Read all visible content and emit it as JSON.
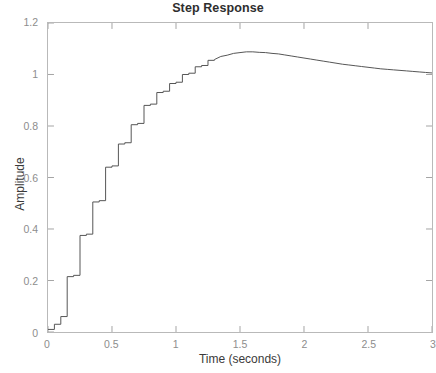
{
  "chart_data": {
    "type": "line",
    "title": "Step Response",
    "xlabel": "Time (seconds)",
    "ylabel": "Amplitude",
    "xlim": [
      0,
      3
    ],
    "ylim": [
      0,
      1.2
    ],
    "xticks": [
      "0",
      "0.5",
      "1",
      "1.5",
      "2",
      "2.5",
      "3"
    ],
    "xtick_values": [
      0,
      0.5,
      1,
      1.5,
      2,
      2.5,
      3
    ],
    "yticks": [
      "0",
      "0.2",
      "0.4",
      "0.6",
      "0.8",
      "1",
      "1.2"
    ],
    "ytick_values": [
      0,
      0.2,
      0.4,
      0.6,
      0.8,
      1,
      1.2
    ],
    "grid": false,
    "legend": null,
    "line_color": "#555555",
    "line_width": 1,
    "drawstyle": "steps-post",
    "sample_period": 0.05,
    "series": [
      {
        "name": "Step Response",
        "x": [
          0.0,
          0.05,
          0.1,
          0.15,
          0.2,
          0.25,
          0.3,
          0.35,
          0.4,
          0.45,
          0.5,
          0.55,
          0.6,
          0.65,
          0.7,
          0.75,
          0.8,
          0.85,
          0.9,
          0.95,
          1.0,
          1.05,
          1.1,
          1.15,
          1.2,
          1.25,
          1.3,
          1.35,
          1.4,
          1.45,
          1.5,
          1.55,
          1.6,
          1.65,
          1.7,
          1.75,
          1.8,
          1.85,
          1.9,
          1.95,
          2.0,
          2.05,
          2.1,
          2.15,
          2.2,
          2.25,
          2.3,
          2.35,
          2.4,
          2.45,
          2.5,
          2.55,
          2.6,
          2.65,
          2.7,
          2.75,
          2.8,
          2.85,
          2.9,
          2.95,
          3.0
        ],
        "y": [
          0.01,
          0.03,
          0.06,
          0.215,
          0.22,
          0.375,
          0.38,
          0.505,
          0.51,
          0.64,
          0.645,
          0.73,
          0.735,
          0.805,
          0.81,
          0.88,
          0.885,
          0.93,
          0.935,
          0.965,
          0.97,
          1.0,
          1.005,
          1.03,
          1.035,
          1.055,
          1.058,
          1.07,
          1.075,
          1.082,
          1.085,
          1.088,
          1.088,
          1.086,
          1.085,
          1.082,
          1.08,
          1.076,
          1.072,
          1.068,
          1.064,
          1.06,
          1.056,
          1.052,
          1.048,
          1.044,
          1.04,
          1.037,
          1.034,
          1.031,
          1.028,
          1.025,
          1.022,
          1.02,
          1.018,
          1.016,
          1.014,
          1.012,
          1.01,
          1.008,
          1.006
        ]
      }
    ],
    "annotations": {
      "peak_value": 1.088,
      "peak_time": 1.05,
      "settling_value": 1.0
    }
  },
  "axes": {
    "box_color": "#b9b9b9",
    "tick_color": "#8d8d8d"
  }
}
